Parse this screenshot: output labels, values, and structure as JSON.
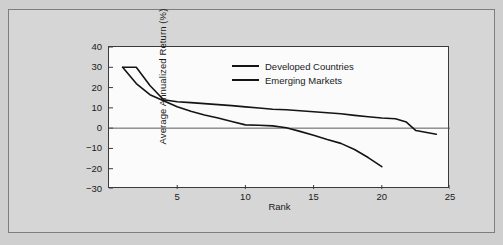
{
  "figure": {
    "background_color": "#d6d6d6",
    "page_background_color": "#cfcfcf",
    "panel_background_color": "#fbfbfb",
    "border_color": "#7e7e7e"
  },
  "chart_data": {
    "type": "line",
    "title": "",
    "xlabel": "Rank",
    "ylabel": "Average Annualized Return (%)",
    "xlim": [
      0,
      25
    ],
    "ylim": [
      -30,
      40
    ],
    "xticks": [
      5,
      10,
      15,
      20,
      25
    ],
    "xtick_labels": [
      "5",
      "10",
      "15",
      "20",
      "25"
    ],
    "yticks": [
      40,
      30,
      20,
      10,
      0,
      -10,
      -20,
      -30
    ],
    "ytick_labels": [
      "40",
      "30",
      "20",
      "10",
      "0",
      "-10",
      "-20",
      "-30"
    ],
    "grid": false,
    "zero_line": true,
    "legend_position": "upper center",
    "line_color": "#141414",
    "series": [
      {
        "name": "Developed Countries",
        "x": [
          1,
          2,
          3,
          4,
          5,
          6,
          7,
          8,
          9,
          10,
          11,
          12,
          13,
          14,
          15,
          16,
          17,
          18,
          19,
          20,
          21,
          21.8,
          22.5,
          24
        ],
        "values": [
          30,
          30,
          21,
          14,
          13,
          12.6,
          12.1,
          11.6,
          11.1,
          10.5,
          9.9,
          9.3,
          9.1,
          8.6,
          8.1,
          7.6,
          7.1,
          6.3,
          5.6,
          5.0,
          4.6,
          3.0,
          -1.2,
          -3.0
        ]
      },
      {
        "name": "Emerging Markets",
        "x": [
          1,
          2,
          3,
          4,
          5,
          6,
          7,
          8,
          9,
          10,
          11,
          12,
          13,
          14,
          15,
          16,
          17,
          18,
          19,
          20
        ],
        "values": [
          30,
          22,
          16.5,
          13.5,
          10.5,
          8.3,
          6.5,
          5.0,
          3.3,
          1.6,
          1.4,
          1.1,
          0.2,
          -1.6,
          -3.5,
          -5.6,
          -7.5,
          -10.5,
          -14.5,
          -19.0
        ]
      }
    ]
  },
  "legend": {
    "items": [
      {
        "label": "Developed Countries"
      },
      {
        "label": "Emerging Markets"
      }
    ]
  }
}
